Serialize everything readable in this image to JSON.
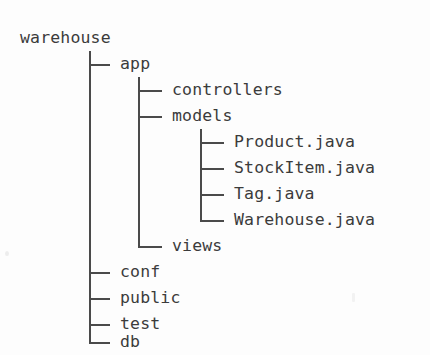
{
  "figure": {
    "kind": "ascii-directory-tree",
    "background_color": "#fdfdfd",
    "text_color": "#3b3b3b",
    "line_color": "#4a4a4a",
    "branch_glyph_tee": "├─",
    "branch_glyph_elbow": "└─",
    "trunk_glyph": "│"
  },
  "root": {
    "label": "warehouse",
    "x": 20,
    "y": 25
  },
  "nodes": [
    {
      "label": "app",
      "depth": 1,
      "row": 1,
      "last": false,
      "x": 120,
      "y": 51
    },
    {
      "label": "controllers",
      "depth": 2,
      "row": 2,
      "last": false,
      "x": 172,
      "y": 77
    },
    {
      "label": "models",
      "depth": 2,
      "row": 3,
      "last": false,
      "x": 172,
      "y": 103
    },
    {
      "label": "Product.java",
      "depth": 3,
      "row": 4,
      "last": false,
      "x": 234,
      "y": 129
    },
    {
      "label": "StockItem.java",
      "depth": 3,
      "row": 5,
      "last": false,
      "x": 234,
      "y": 155
    },
    {
      "label": "Tag.java",
      "depth": 3,
      "row": 6,
      "last": false,
      "x": 234,
      "y": 181
    },
    {
      "label": "Warehouse.java",
      "depth": 3,
      "row": 7,
      "last": true,
      "x": 234,
      "y": 207
    },
    {
      "label": "views",
      "depth": 2,
      "row": 8,
      "last": true,
      "x": 172,
      "y": 233
    },
    {
      "label": "conf",
      "depth": 1,
      "row": 9,
      "last": false,
      "x": 120,
      "y": 259
    },
    {
      "label": "public",
      "depth": 1,
      "row": 10,
      "last": false,
      "x": 120,
      "y": 285
    },
    {
      "label": "test",
      "depth": 1,
      "row": 11,
      "last": false,
      "x": 120,
      "y": 311
    },
    {
      "label": "db",
      "depth": 1,
      "row": 12,
      "last": true,
      "x": 120,
      "y": 329
    }
  ],
  "trunks": [
    {
      "depth": 1,
      "x": 89,
      "top": 51,
      "bottom": 337
    },
    {
      "depth": 2,
      "x": 138,
      "top": 77,
      "bottom": 241
    },
    {
      "depth": 3,
      "x": 200,
      "top": 129,
      "bottom": 215
    }
  ]
}
